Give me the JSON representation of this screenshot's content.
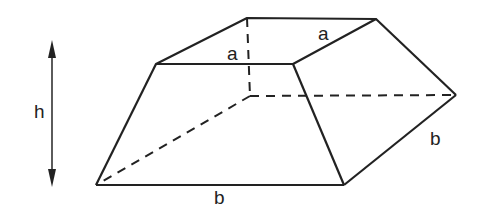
{
  "diagram": {
    "labels": {
      "height": "h",
      "top_edge_front": "a",
      "top_edge_side": "a",
      "bottom_edge_front": "b",
      "bottom_edge_side": "b"
    },
    "colors": {
      "stroke": "#222222",
      "background": "#ffffff"
    }
  }
}
